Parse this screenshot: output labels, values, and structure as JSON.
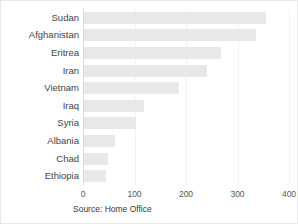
{
  "chart_data": {
    "type": "bar",
    "orientation": "horizontal",
    "title": "",
    "subtitle": "",
    "xlabel": "",
    "ylabel": "",
    "categories": [
      "Sudan",
      "Afghanistan",
      "Eritrea",
      "Iran",
      "Vietnam",
      "Iraq",
      "Syria",
      "Albania",
      "Chad",
      "Ethiopia"
    ],
    "values": [
      355,
      336,
      268,
      241,
      186,
      118,
      103,
      62,
      49,
      45
    ],
    "series": [
      {
        "name": "",
        "values": [
          355,
          336,
          268,
          241,
          186,
          118,
          103,
          62,
          49,
          45
        ]
      }
    ],
    "xlim": [
      0,
      400
    ],
    "xticks": [
      0,
      100,
      200,
      300,
      400
    ],
    "xtick_labels": [
      "0",
      "100",
      "200",
      "300",
      "400"
    ],
    "grid": true,
    "legend": false,
    "legend_position": "none",
    "annotations": [
      "Source: Home Office"
    ],
    "bar_color": "#e8e8e8",
    "grid_color": "#f2f2f2",
    "axis_color": "#d9d9d9",
    "label_color": "#444444"
  },
  "footer": {
    "source": "Source: Home Office"
  }
}
